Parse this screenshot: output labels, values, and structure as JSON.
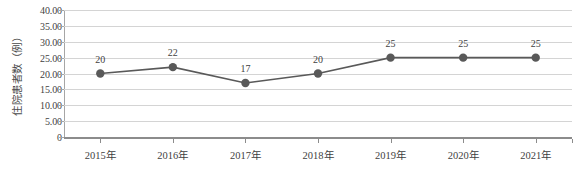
{
  "chart_data": {
    "type": "line",
    "title": "",
    "xlabel": "",
    "ylabel": "住院患者数（例）",
    "categories": [
      "2015年",
      "2016年",
      "2017年",
      "2018年",
      "2019年",
      "2020年",
      "2021年"
    ],
    "values": [
      20,
      22,
      17,
      20,
      25,
      25,
      25
    ],
    "data_labels": [
      "20",
      "22",
      "17",
      "20",
      "25",
      "25",
      "25"
    ],
    "ylim": [
      0,
      40
    ],
    "ytick_values": [
      0,
      5,
      10,
      15,
      20,
      25,
      30,
      35,
      40
    ],
    "ytick_labels": [
      "0",
      "5.00",
      "10.00",
      "15.00",
      "20.00",
      "25.00",
      "30.00",
      "35.00",
      "40.00"
    ],
    "grid": true,
    "grid_axis": "y",
    "legend": false,
    "legend_position": "none",
    "series_color": "#595959",
    "marker": "circle",
    "marker_color": "#595959",
    "grid_color": "#d4d4d4",
    "axis_color": "#8c8c8c"
  }
}
